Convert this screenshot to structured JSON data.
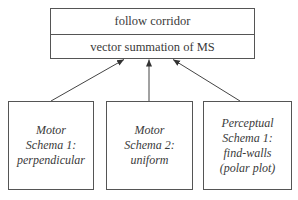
{
  "top_box": {
    "row1": "follow corridor",
    "row2": "vector summation of MS"
  },
  "schemas": [
    {
      "lines": [
        "Motor",
        "Schema 1:",
        "perpendicular"
      ]
    },
    {
      "lines": [
        "Motor",
        "Schema 2:",
        "uniform"
      ]
    },
    {
      "lines": [
        "Perceptual",
        "Schema 1:",
        "find-walls",
        "(polar plot)"
      ]
    }
  ],
  "colors": {
    "stroke": "#555555",
    "text": "#3a3a3a",
    "background": "#ffffff"
  }
}
